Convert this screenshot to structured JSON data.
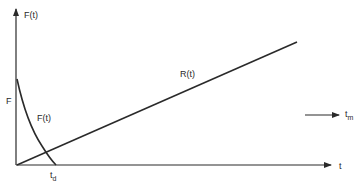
{
  "diagram": {
    "y_axis_label": "F(t)",
    "x_axis_label": "t",
    "initial_value_label": "F",
    "decay_curve_label": "F(t)",
    "decay_end_label": {
      "base": "t",
      "sub": "d"
    },
    "ramp_line_label": "R(t)",
    "side_arrow_label": {
      "base": "t",
      "sub": "m"
    },
    "colors": {
      "stroke": "#2a2a2a",
      "background": "#ffffff"
    }
  }
}
